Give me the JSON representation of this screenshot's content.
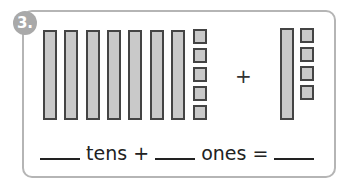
{
  "problem": {
    "number": "3.",
    "left_group": {
      "tens": 7,
      "ones": 5
    },
    "right_group": {
      "tens": 1,
      "ones": 4
    },
    "operator": "+",
    "equation": {
      "tens_label": "tens",
      "plus": "+",
      "ones_label": "ones",
      "equals": "="
    }
  }
}
